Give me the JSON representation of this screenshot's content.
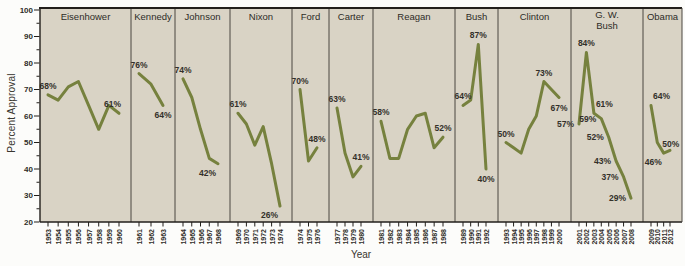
{
  "colors": {
    "panel_bg": "#d9d3c5",
    "line": "#76813e",
    "axis": "#221f1b",
    "divider": "#4a4641",
    "text": "#2e2c27",
    "label_text": "#33302a",
    "figure_bg": "#fcfcfa"
  },
  "chart_data": {
    "type": "line",
    "title": "",
    "ylabel": "Percent Approval",
    "xlabel": "Year",
    "ylim": [
      20,
      100
    ],
    "y_ticks": [
      100,
      90,
      80,
      70,
      60,
      50,
      40,
      30,
      20
    ],
    "y_minor_tick_step": 5,
    "grid": false,
    "legend": "none",
    "panels": [
      {
        "president": "Eisenhower",
        "years": [
          1953,
          1954,
          1955,
          1956,
          1957,
          1958,
          1959,
          1960
        ],
        "values": [
          68,
          66,
          71,
          73,
          64,
          55,
          64,
          61
        ],
        "labels": [
          {
            "year": 1953,
            "text": "68%",
            "pos": "above"
          },
          {
            "year": 1960,
            "text": "61%",
            "pos": "above-left"
          }
        ]
      },
      {
        "president": "Kennedy",
        "years": [
          1961,
          1962,
          1963
        ],
        "values": [
          76,
          72,
          64
        ],
        "labels": [
          {
            "year": 1961,
            "text": "76%",
            "pos": "above"
          },
          {
            "year": 1963,
            "text": "64%",
            "pos": "below"
          }
        ]
      },
      {
        "president": "Johnson",
        "years": [
          1964,
          1965,
          1966,
          1967,
          1968
        ],
        "values": [
          74,
          67,
          55,
          44,
          42
        ],
        "labels": [
          {
            "year": 1964,
            "text": "74%",
            "pos": "above"
          },
          {
            "year": 1968,
            "text": "42%",
            "pos": "below-left"
          }
        ]
      },
      {
        "president": "Nixon",
        "years": [
          1969,
          1970,
          1971,
          1972,
          1973,
          1974
        ],
        "values": [
          61,
          57,
          49,
          56,
          42,
          26
        ],
        "labels": [
          {
            "year": 1969,
            "text": "61%",
            "pos": "above"
          },
          {
            "year": 1974,
            "text": "26%",
            "pos": "below-left"
          }
        ]
      },
      {
        "president": "Ford",
        "years": [
          1974,
          1975,
          1976
        ],
        "values": [
          70,
          43,
          48
        ],
        "labels": [
          {
            "year": 1974,
            "text": "70%",
            "pos": "above"
          },
          {
            "year": 1976,
            "text": "48%",
            "pos": "above"
          }
        ]
      },
      {
        "president": "Carter",
        "years": [
          1977,
          1978,
          1979,
          1980
        ],
        "values": [
          63,
          46,
          37,
          41
        ],
        "labels": [
          {
            "year": 1977,
            "text": "63%",
            "pos": "above"
          },
          {
            "year": 1980,
            "text": "41%",
            "pos": "above"
          }
        ]
      },
      {
        "president": "Reagan",
        "years": [
          1981,
          1982,
          1983,
          1984,
          1985,
          1986,
          1987,
          1988
        ],
        "values": [
          58,
          44,
          44,
          55,
          60,
          61,
          48,
          52
        ],
        "labels": [
          {
            "year": 1981,
            "text": "58%",
            "pos": "above"
          },
          {
            "year": 1988,
            "text": "52%",
            "pos": "above"
          }
        ]
      },
      {
        "president": "Bush",
        "years": [
          1989,
          1990,
          1991,
          1992
        ],
        "values": [
          64,
          66,
          87,
          40
        ],
        "labels": [
          {
            "year": 1989,
            "text": "64%",
            "pos": "above"
          },
          {
            "year": 1991,
            "text": "87%",
            "pos": "above"
          },
          {
            "year": 1992,
            "text": "40%",
            "pos": "below"
          }
        ]
      },
      {
        "president": "Clinton",
        "years": [
          1993,
          1994,
          1995,
          1996,
          1997,
          1998,
          1999,
          2000
        ],
        "values": [
          50,
          48,
          46,
          55,
          60,
          73,
          70,
          67
        ],
        "labels": [
          {
            "year": 1993,
            "text": "50%",
            "pos": "above"
          },
          {
            "year": 1998,
            "text": "73%",
            "pos": "above"
          },
          {
            "year": 2000,
            "text": "67%",
            "pos": "below"
          }
        ]
      },
      {
        "president": "G. W.\nBush",
        "years": [
          2001,
          2002,
          2003,
          2004,
          2005,
          2006,
          2007,
          2008
        ],
        "values": [
          57,
          84,
          61,
          59,
          52,
          43,
          37,
          29
        ],
        "labels": [
          {
            "year": 2001,
            "text": "57%",
            "pos": "left"
          },
          {
            "year": 2002,
            "text": "84%",
            "pos": "above"
          },
          {
            "year": 2003,
            "text": "61%",
            "pos": "above-right"
          },
          {
            "year": 2004,
            "text": "59%",
            "pos": "left"
          },
          {
            "year": 2005,
            "text": "52%",
            "pos": "left"
          },
          {
            "year": 2006,
            "text": "43%",
            "pos": "left"
          },
          {
            "year": 2007,
            "text": "37%",
            "pos": "left"
          },
          {
            "year": 2008,
            "text": "29%",
            "pos": "left"
          }
        ]
      },
      {
        "president": "Obama",
        "years": [
          2009,
          2010,
          2011,
          2012
        ],
        "values": [
          64,
          50,
          46,
          47
        ],
        "labels": [
          {
            "year": 2009,
            "text": "64%",
            "pos": "above-right"
          },
          {
            "year": 2010,
            "text": "50%",
            "pos": "right"
          },
          {
            "year": 2011,
            "text": "46%",
            "pos": "below-left"
          }
        ]
      }
    ]
  }
}
